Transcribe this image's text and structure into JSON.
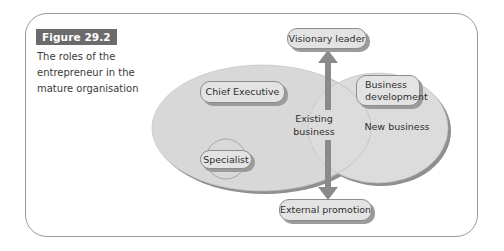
{
  "figure": {
    "label": "Figure 29.2",
    "caption_lines": [
      "The roles of the",
      "entrepreneur in the",
      "mature organisation"
    ]
  },
  "diagram": {
    "ellipses": [
      {
        "id": "existing-business",
        "label_lines": [
          "Existing",
          "business"
        ]
      },
      {
        "id": "new-business",
        "label": "New business"
      }
    ],
    "roles": {
      "visionary_leader": "Visionary leader",
      "chief_executive": "Chief Executive",
      "specialist": "Specialist",
      "business_development_lines": [
        "Business",
        "development"
      ],
      "external_promotion": "External promotion"
    },
    "arrows": [
      {
        "from": "boundary",
        "to": "Visionary leader",
        "direction": "up"
      },
      {
        "from": "boundary",
        "to": "External promotion",
        "direction": "down"
      }
    ],
    "colors": {
      "ellipse_fill": "#d8d8d8",
      "ellipse_shadow": "#8f8f8f",
      "pill_fill": "#e3e3e3",
      "arrow": "#8a8a8a",
      "label_bg": "#6b6b6b",
      "frame": "#9a9a9a"
    }
  }
}
